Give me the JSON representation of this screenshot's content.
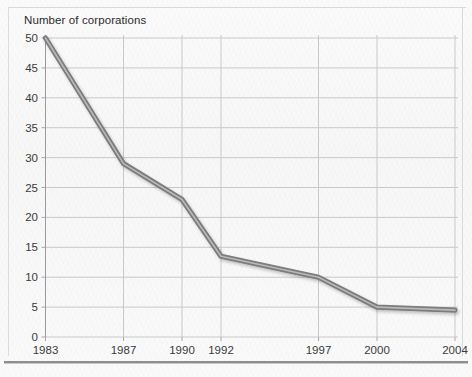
{
  "chart_data": {
    "type": "line",
    "title": "Number of corporations",
    "xlabel": "",
    "ylabel": "",
    "categories": [
      "1983",
      "1987",
      "1990",
      "1992",
      "1997",
      "2000",
      "2004"
    ],
    "x": [
      1983,
      1987,
      1990,
      1992,
      1997,
      2000,
      2004
    ],
    "values": [
      50,
      29,
      23,
      13.5,
      10,
      5,
      4.5
    ],
    "series": [
      {
        "name": "Number of corporations",
        "values": [
          50,
          29,
          23,
          13.5,
          10,
          5,
          4.5
        ]
      }
    ],
    "ylim": [
      0,
      50
    ],
    "xlim": [
      1983,
      2004
    ],
    "ytick_labels": [
      "0",
      "5",
      "10",
      "15",
      "20",
      "25",
      "30",
      "35",
      "40",
      "45",
      "50"
    ],
    "yticks": [
      0,
      5,
      10,
      15,
      20,
      25,
      30,
      35,
      40,
      45,
      50
    ],
    "xtick_labels": [
      "1983",
      "1987",
      "1990",
      "1992",
      "1997",
      "2000",
      "2004"
    ],
    "grid": true,
    "legend": false,
    "legend_position": "none",
    "line_color": "#7c7c7c",
    "grid_color": "#c9c9c9",
    "axis_color": "#a8a8a8",
    "background_color": "#f8f8f8",
    "text_color": "#3a3a3a"
  }
}
